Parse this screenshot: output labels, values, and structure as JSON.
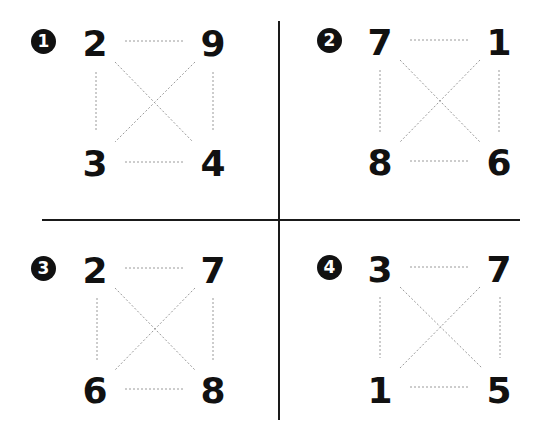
{
  "puzzles": [
    {
      "badge": "1",
      "tl": "2",
      "tr": "9",
      "bl": "3",
      "br": "4"
    },
    {
      "badge": "2",
      "tl": "7",
      "tr": "1",
      "bl": "8",
      "br": "6"
    },
    {
      "badge": "3",
      "tl": "2",
      "tr": "7",
      "bl": "6",
      "br": "8"
    },
    {
      "badge": "4",
      "tl": "3",
      "tr": "7",
      "bl": "1",
      "br": "5"
    }
  ],
  "colors": {
    "ink": "#111111",
    "dotted": "#9a9a9a"
  }
}
